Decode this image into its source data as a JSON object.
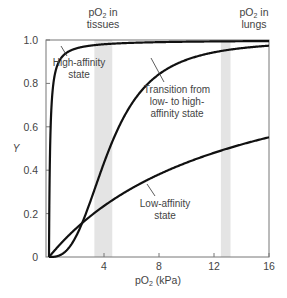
{
  "chart_data": {
    "type": "line",
    "title": "",
    "xlabel": "pO2 (kPa)",
    "ylabel": "Y",
    "xlim": [
      0,
      16
    ],
    "ylim": [
      0,
      1.0
    ],
    "x_ticks": [
      4,
      8,
      12,
      16
    ],
    "x_tick_labels": [
      "4",
      "8",
      "12",
      "16"
    ],
    "y_ticks": [
      0,
      0.2,
      0.4,
      0.6,
      0.8,
      1.0
    ],
    "y_tick_labels": [
      "0",
      "0.2",
      "0.4",
      "0.6",
      "0.8",
      "1.0"
    ],
    "grid": false,
    "legend": null,
    "shaded_regions": [
      {
        "name": "pO2 in tissues",
        "label_line1": "pO",
        "sub": "2",
        "label_suffix": " in",
        "label_line2": "tissues",
        "x_range": [
          3.3,
          4.6
        ],
        "color": "#e4e4e4"
      },
      {
        "name": "pO2 in lungs",
        "label_line1": "pO",
        "sub": "2",
        "label_suffix": " in",
        "label_line2": "lungs",
        "x_range": [
          12.5,
          13.2
        ],
        "color": "#e4e4e4"
      }
    ],
    "series": [
      {
        "name": "High-affinity state",
        "model": "hill",
        "p50": 0.08,
        "n": 1.0,
        "x": [
          0,
          0.05,
          0.1,
          0.25,
          0.5,
          1,
          2,
          4,
          8,
          12,
          16
        ],
        "values": [
          0,
          0.38,
          0.56,
          0.76,
          0.86,
          0.93,
          0.96,
          0.98,
          0.99,
          0.995,
          1.0
        ]
      },
      {
        "name": "Transition from low- to high-affinity state",
        "model": "hill",
        "p50": 4.4,
        "n": 2.8,
        "x": [
          0,
          1,
          2,
          3,
          4,
          5,
          6,
          8,
          10,
          12,
          14,
          16
        ],
        "values": [
          0,
          0.02,
          0.1,
          0.25,
          0.44,
          0.59,
          0.7,
          0.84,
          0.9,
          0.94,
          0.96,
          0.97
        ]
      },
      {
        "name": "Low-affinity state",
        "model": "hill",
        "p50": 13.0,
        "n": 1.0,
        "x": [
          0,
          2,
          4,
          6,
          8,
          10,
          12,
          14,
          16
        ],
        "values": [
          0,
          0.13,
          0.24,
          0.32,
          0.38,
          0.43,
          0.48,
          0.52,
          0.55
        ]
      }
    ],
    "annotations": [
      {
        "text_lines": [
          "High-affinity",
          "state"
        ],
        "target_series": "High-affinity state"
      },
      {
        "text_lines": [
          "Transition from",
          "low- to high-",
          "affinity state"
        ],
        "target_series": "Transition from low- to high-affinity state"
      },
      {
        "text_lines": [
          "Low-affinity",
          "state"
        ],
        "target_series": "Low-affinity state"
      }
    ]
  }
}
